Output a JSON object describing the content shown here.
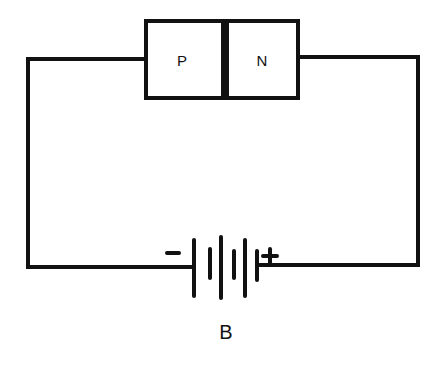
{
  "diagram": {
    "type": "circuit",
    "junction": {
      "p_label": "P",
      "n_label": "N"
    },
    "battery": {
      "label": "B",
      "negative_symbol": "−",
      "positive_symbol": "+",
      "cells": 3
    },
    "colors": {
      "line": "#111111",
      "background": "#ffffff"
    }
  }
}
